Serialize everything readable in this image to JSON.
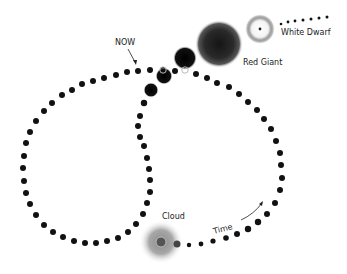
{
  "diagram": {
    "labels": {
      "now": "NOW",
      "red_giant": "Red Giant",
      "white_dwarf": "White Dwarf",
      "cloud": "Cloud",
      "time": "Time"
    },
    "stages": [
      "Cloud",
      "NOW",
      "Red Giant",
      "White Dwarf"
    ],
    "colors": {
      "dot": "#111111",
      "cloud": "#9a9a9a",
      "text": "#222222"
    }
  }
}
